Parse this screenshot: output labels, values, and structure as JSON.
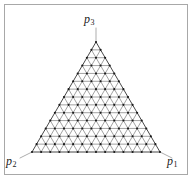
{
  "figure": {
    "type": "ternary-simplex-lattice",
    "background_color": "#ffffff",
    "frame": {
      "visible": true,
      "border_color": "#a8a8a8",
      "border_width_px": 1,
      "x": 4,
      "y": 4,
      "width": 184,
      "height": 171
    }
  },
  "labels": {
    "p3": {
      "symbol": "p",
      "subscript": "3",
      "text": "p3"
    },
    "p2": {
      "symbol": "p",
      "subscript": "2",
      "text": "p2"
    },
    "p1": {
      "symbol": "p",
      "subscript": "1",
      "text": "p1"
    }
  },
  "chart_data": {
    "type": "scatter",
    "title": "",
    "xlabel": "",
    "ylabel": "",
    "grid": true,
    "legend": "none",
    "simplex": {
      "dimension": 2,
      "subdivisions": 14,
      "vertex_count": 120,
      "corner_labels": [
        "p1",
        "p2",
        "p3"
      ]
    },
    "geometry_px": {
      "apex": {
        "x": 96,
        "y": 42
      },
      "bottom_left": {
        "x": 32,
        "y": 152
      },
      "bottom_right": {
        "x": 160,
        "y": 152
      }
    },
    "style": {
      "lattice_line_color": "#555555",
      "lattice_line_width": 0.55,
      "outline_color": "#333333",
      "outline_width": 0.9,
      "node_color": "#1a1a1a",
      "node_radius": 1.05,
      "leader_color": "#8a8a8a",
      "leader_width": 0.7
    },
    "leaders_px": [
      {
        "name": "leader-p3",
        "x1": 96,
        "y1": 28,
        "x2": 96,
        "y2": 42
      },
      {
        "name": "leader-p2",
        "x1": 20,
        "y1": 158,
        "x2": 32,
        "y2": 152
      },
      {
        "name": "leader-p1",
        "x1": 172,
        "y1": 158,
        "x2": 160,
        "y2": 152
      }
    ]
  }
}
